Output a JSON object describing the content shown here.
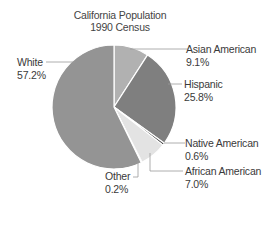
{
  "chart_data": {
    "type": "pie",
    "title": "California Population",
    "subtitle": "1990 Census",
    "categories": [
      "Asian American",
      "Hispanic",
      "Native American",
      "African American",
      "Other",
      "White"
    ],
    "values": [
      9.1,
      25.8,
      0.6,
      7.0,
      0.2,
      57.2
    ],
    "unit": "%",
    "slices": [
      {
        "label": "Asian American",
        "value": 9.1,
        "value_label": "9.1%",
        "color": "#b1b1b1"
      },
      {
        "label": "Hispanic",
        "value": 25.8,
        "value_label": "25.8%",
        "color": "#7f7f7f"
      },
      {
        "label": "Native American",
        "value": 0.6,
        "value_label": "0.6%",
        "color": "#4a4a4a"
      },
      {
        "label": "African American",
        "value": 7.0,
        "value_label": "7.0%",
        "color": "#e3e3e3"
      },
      {
        "label": "Other",
        "value": 0.2,
        "value_label": "0.2%",
        "color": "#4a4a4a"
      },
      {
        "label": "White",
        "value": 57.2,
        "value_label": "57.2%",
        "color": "#949494"
      }
    ],
    "start_angle_deg": 0,
    "direction": "clockwise",
    "legend": "callout labels"
  }
}
